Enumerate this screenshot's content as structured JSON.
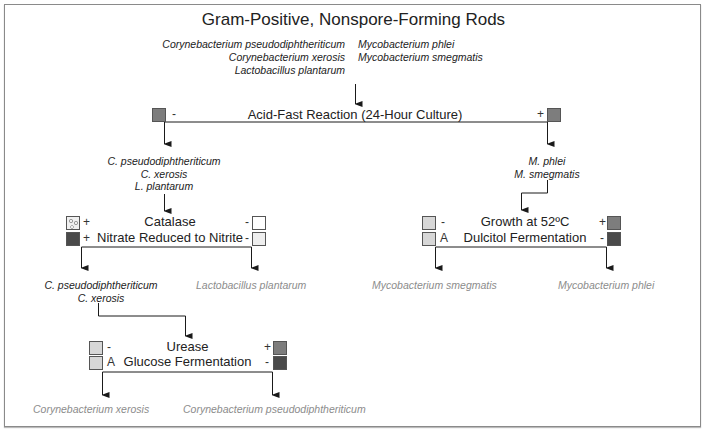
{
  "title": "Gram-Positive, Nonspore-Forming Rods",
  "start_organisms": {
    "left": [
      "Corynebacterium pseudodiphtheriticum",
      "Corynebacterium xerosis",
      "Lactobacillus plantarum"
    ],
    "right": [
      "Mycobacterium phlei",
      "Mycobacterium smegmatis"
    ]
  },
  "acid_fast": {
    "label": "Acid-Fast Reaction (24-Hour Culture)",
    "neg_sign": "-",
    "pos_sign": "+"
  },
  "neg_branch_organisms": [
    "C. pseudodiphtheriticum",
    "C. xerosis",
    "L. plantarum"
  ],
  "pos_branch_organisms": [
    "M. phlei",
    "M. smegmatis"
  ],
  "catalase_test": {
    "row1": {
      "label": "Catalase",
      "left_sign": "+",
      "right_sign": "-"
    },
    "row2": {
      "label": "Nitrate Reduced to Nitrite",
      "left_sign": "+",
      "right_sign": "-"
    }
  },
  "catalase_results": {
    "left": [
      "C. pseudodiphtheriticum",
      "C. xerosis"
    ],
    "right": "Lactobacillus plantarum"
  },
  "urease_test": {
    "row1": {
      "label": "Urease",
      "left_sign": "-",
      "right_sign": "+"
    },
    "row2": {
      "label": "Glucose Fermentation",
      "left_sign": "A",
      "right_sign": "-"
    }
  },
  "urease_results": {
    "left": "Corynebacterium xerosis",
    "right": "Corynebacterium pseudodiphtheriticum"
  },
  "growth_test": {
    "row1": {
      "label": "Growth at 52ºC",
      "left_sign": "-",
      "right_sign": "+"
    },
    "row2": {
      "label": "Dulcitol Fermentation",
      "left_sign": "A",
      "right_sign": "-"
    }
  },
  "growth_results": {
    "left": "Mycobacterium smegmatis",
    "right": "Mycobacterium phlei"
  },
  "colors": {
    "line": "#1a1a1a",
    "final_result_text": "#8c8c8c",
    "box_mid": "#7d7d7d",
    "box_dark": "#4a4a4a",
    "box_light": "#d7d7d7"
  }
}
